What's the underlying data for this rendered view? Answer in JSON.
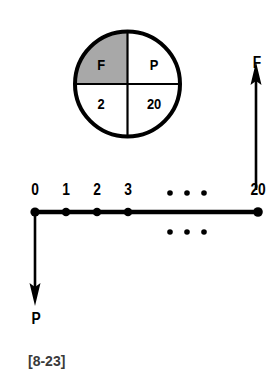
{
  "figure": {
    "caption": "[8-23]",
    "colors": {
      "ink": "#000000",
      "shaded_quadrant": "#a8a8a8",
      "background": "#ffffff",
      "caption": "#3a3a3a"
    }
  },
  "circle_diagram": {
    "name": "quadrant-circle",
    "description": "Circle divided into four quadrants by vertical and horizontal diameters",
    "shaded_quadrant": "top-left",
    "quadrants": [
      {
        "position": "top-left",
        "label": "F",
        "shaded": true
      },
      {
        "position": "top-right",
        "label": "P",
        "shaded": false
      },
      {
        "position": "bottom-left",
        "label": "2",
        "shaded": false
      },
      {
        "position": "bottom-right",
        "label": "20",
        "shaded": false
      }
    ]
  },
  "timeline": {
    "name": "cash-flow-number-line",
    "ticks": [
      {
        "label": "0",
        "value": 0
      },
      {
        "label": "1",
        "value": 1
      },
      {
        "label": "2",
        "value": 2
      },
      {
        "label": "3",
        "value": 3
      },
      {
        "label": "20",
        "value": 20
      }
    ],
    "ellipsis_above": "...",
    "ellipsis_below": "..."
  },
  "arrows": [
    {
      "name": "future-value-arrow",
      "label": "F",
      "direction": "up",
      "at_period": "20"
    },
    {
      "name": "present-value-arrow",
      "label": "P",
      "direction": "down",
      "at_period": "0"
    }
  ]
}
